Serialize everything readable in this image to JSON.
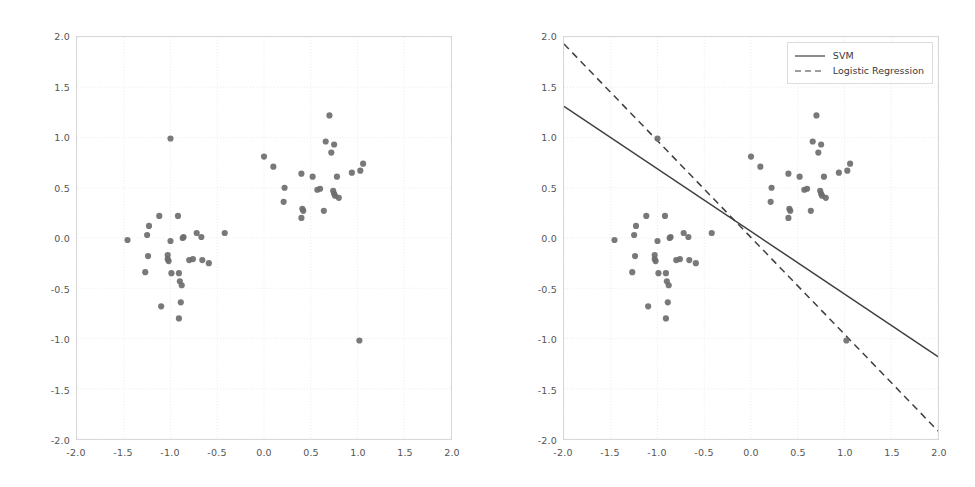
{
  "figure": {
    "background": "#ffffff",
    "point_color": "#6e6e6e",
    "line_color": "#3f3f3f",
    "grid_color": "#e6e6e6",
    "axis_color": "#d8d8d8",
    "tick_text_color": "#555555"
  },
  "axis": {
    "xlim": [
      -2.0,
      2.0
    ],
    "ylim": [
      -2.0,
      2.0
    ],
    "xticks": [
      "-2.0",
      "-1.5",
      "-1.0",
      "-0.5",
      "0.0",
      "0.5",
      "1.0",
      "1.5",
      "2.0"
    ],
    "yticks": [
      "2.0",
      "1.5",
      "1.0",
      "0.5",
      "0.0",
      "-0.5",
      "-1.0",
      "-1.5",
      "-2.0"
    ],
    "xtick_values": [
      -2.0,
      -1.5,
      -1.0,
      -0.5,
      0.0,
      0.5,
      1.0,
      1.5,
      2.0
    ],
    "ytick_values": [
      2.0,
      1.5,
      1.0,
      0.5,
      0.0,
      -0.5,
      -1.0,
      -1.5,
      -2.0
    ]
  },
  "legend": {
    "position": "upper-right",
    "items": [
      {
        "label": "SVM",
        "style": "solid"
      },
      {
        "label": "Logistic Regression",
        "style": "dashed"
      }
    ]
  },
  "chart_data": {
    "type": "scatter",
    "title": "",
    "xlabel": "",
    "ylabel": "",
    "xlim": [
      -2.0,
      2.0
    ],
    "ylim": [
      -2.0,
      2.0
    ],
    "grid": true,
    "legend_position": "upper right",
    "panels": [
      {
        "name": "scatter-only",
        "show_lines": false,
        "legend": false
      },
      {
        "name": "scatter-with-decision-boundaries",
        "show_lines": true,
        "legend": true
      }
    ],
    "series": [
      {
        "name": "samples",
        "marker": "circle",
        "color": "#6e6e6e",
        "points": [
          [
            -1.46,
            -0.02
          ],
          [
            -1.23,
            0.12
          ],
          [
            -1.25,
            0.03
          ],
          [
            -1.12,
            0.22
          ],
          [
            -1.24,
            -0.18
          ],
          [
            -1.27,
            -0.34
          ],
          [
            -1.03,
            -0.17
          ],
          [
            -1.03,
            -0.21
          ],
          [
            -1.02,
            -0.23
          ],
          [
            -1.0,
            0.99
          ],
          [
            -1.0,
            -0.03
          ],
          [
            -0.99,
            -0.35
          ],
          [
            -0.92,
            0.22
          ],
          [
            -0.91,
            -0.35
          ],
          [
            -0.9,
            -0.43
          ],
          [
            -0.88,
            -0.47
          ],
          [
            -0.89,
            -0.64
          ],
          [
            -0.91,
            -0.8
          ],
          [
            -1.1,
            -0.68
          ],
          [
            -0.87,
            0.0
          ],
          [
            -0.86,
            0.01
          ],
          [
            -0.8,
            -0.22
          ],
          [
            -0.76,
            -0.21
          ],
          [
            -0.72,
            0.05
          ],
          [
            -0.67,
            0.01
          ],
          [
            -0.66,
            -0.22
          ],
          [
            -0.59,
            -0.25
          ],
          [
            -0.42,
            0.05
          ],
          [
            0.0,
            0.81
          ],
          [
            0.1,
            0.71
          ],
          [
            0.22,
            0.5
          ],
          [
            0.21,
            0.36
          ],
          [
            0.4,
            0.64
          ],
          [
            0.41,
            0.29
          ],
          [
            0.42,
            0.27
          ],
          [
            0.4,
            0.2
          ],
          [
            0.52,
            0.61
          ],
          [
            0.57,
            0.48
          ],
          [
            0.6,
            0.49
          ],
          [
            0.64,
            0.27
          ],
          [
            0.66,
            0.96
          ],
          [
            0.7,
            1.22
          ],
          [
            0.72,
            0.85
          ],
          [
            0.75,
            0.93
          ],
          [
            0.74,
            0.47
          ],
          [
            0.75,
            0.44
          ],
          [
            0.76,
            0.42
          ],
          [
            0.78,
            0.61
          ],
          [
            0.8,
            0.4
          ],
          [
            0.94,
            0.65
          ],
          [
            1.03,
            0.67
          ],
          [
            1.06,
            0.74
          ],
          [
            1.02,
            -1.02
          ]
        ]
      }
    ],
    "lines": [
      {
        "name": "SVM",
        "style": "solid",
        "color": "#3f3f3f",
        "endpoints": [
          [
            -2.0,
            1.31
          ],
          [
            2.0,
            -1.18
          ]
        ],
        "slope": -0.6225,
        "intercept": 0.065
      },
      {
        "name": "Logistic Regression",
        "style": "dashed",
        "color": "#3f3f3f",
        "endpoints": [
          [
            -2.0,
            1.93
          ],
          [
            2.0,
            -1.92
          ]
        ],
        "slope": -0.9625,
        "intercept": 0.005
      }
    ]
  }
}
